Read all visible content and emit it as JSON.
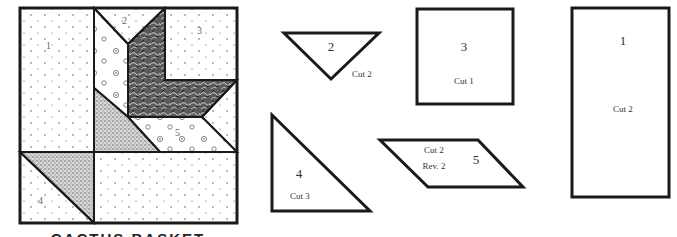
{
  "block": {
    "title": "CACTUS BASKET",
    "piece_labels": {
      "p1": "1",
      "p2": "2",
      "p3": "3",
      "p4": "4",
      "p5": "5"
    }
  },
  "templates": [
    {
      "id": "piece-2",
      "number": "2",
      "cut": "Cut 2",
      "shape": "triangle-down"
    },
    {
      "id": "piece-3",
      "number": "3",
      "cut": "Cut 1",
      "shape": "square"
    },
    {
      "id": "piece-1",
      "number": "1",
      "cut": "Cut 2",
      "shape": "rectangle"
    },
    {
      "id": "piece-4",
      "number": "4",
      "cut": "Cut 3",
      "shape": "right-triangle"
    },
    {
      "id": "piece-5",
      "number": "5",
      "cut": "Cut 2",
      "rev": "Rev. 2",
      "shape": "parallelogram"
    }
  ],
  "colors": {
    "line": "#1a1a1a",
    "stipple": "#9a9a9a",
    "dark_print": "#3a3a3a",
    "background": "#ffffff"
  }
}
